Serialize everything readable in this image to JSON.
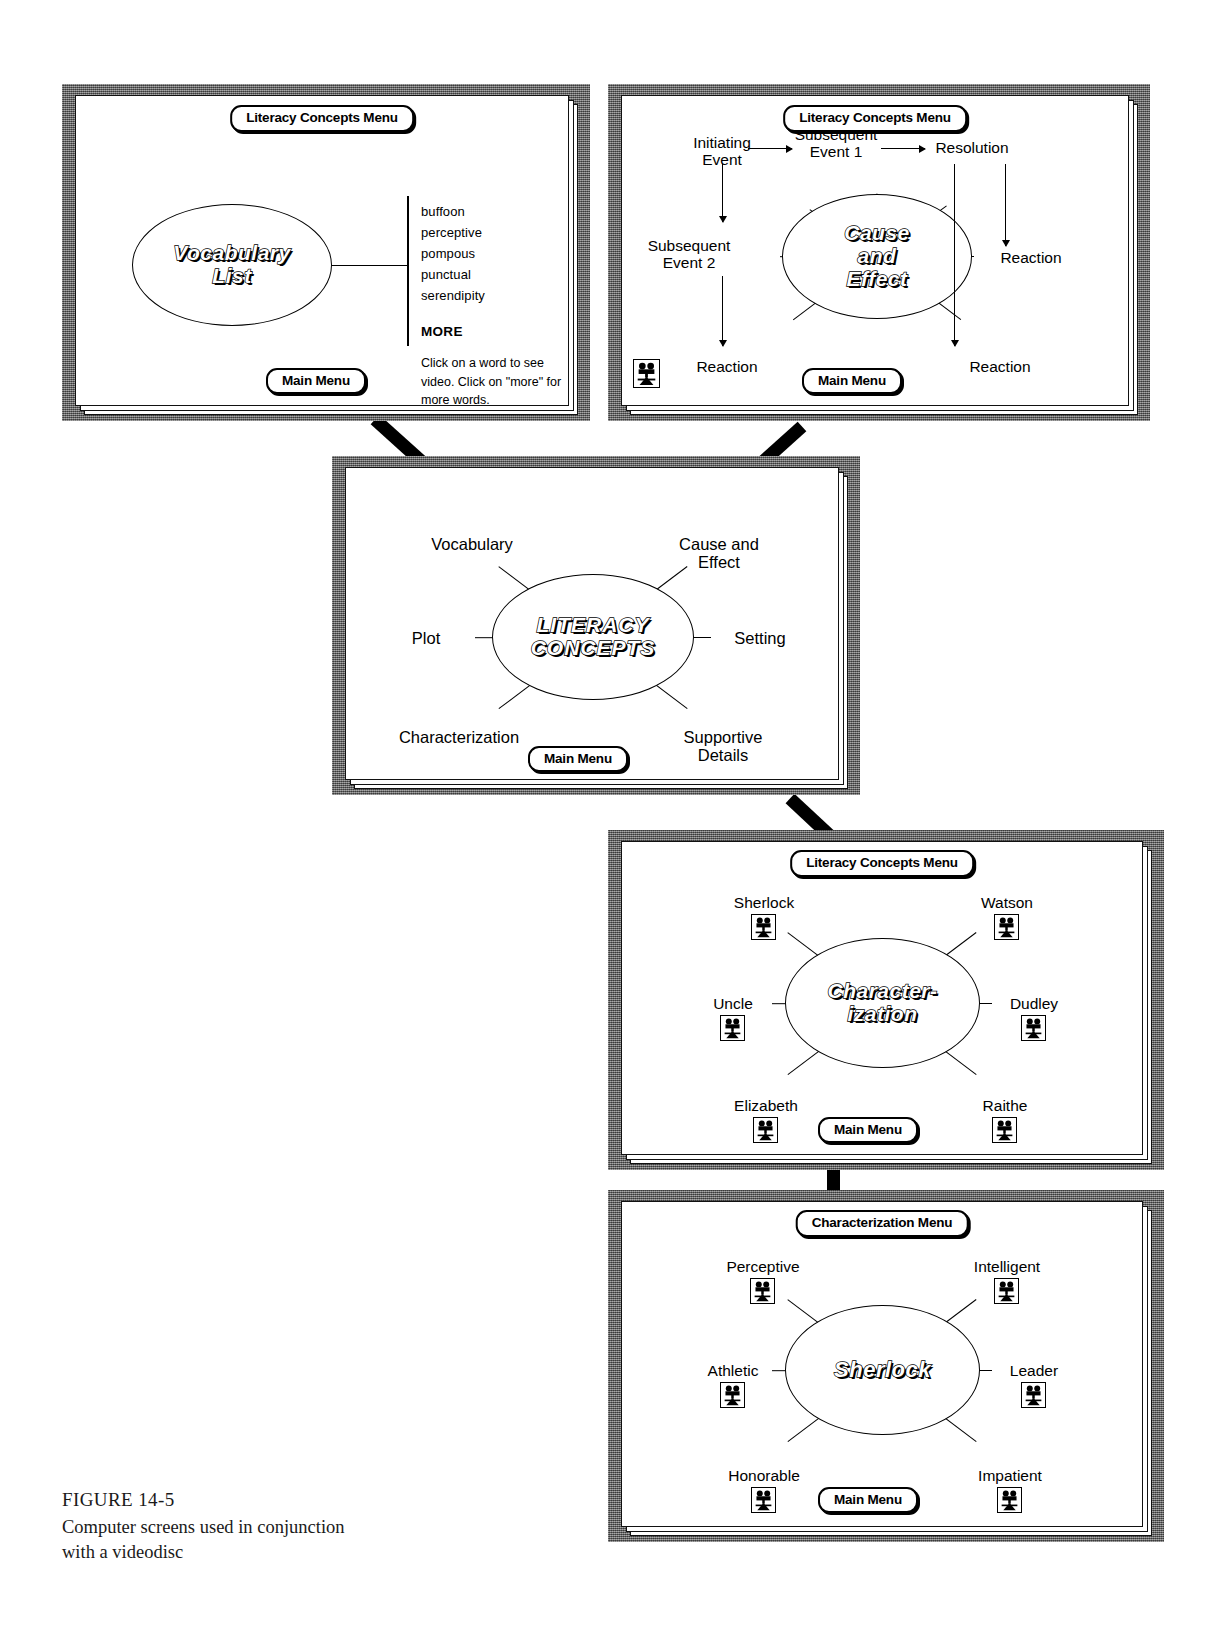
{
  "figure": {
    "number": "FIGURE 14-5",
    "caption": "Computer screens used in conjunction\nwith a videodisc"
  },
  "labels": {
    "main_menu": "Main Menu",
    "literacy_concepts_menu": "Literacy Concepts Menu",
    "characterization_menu": "Characterization Menu"
  },
  "screens": [
    {
      "id": "vocabulary-list",
      "titlebar": "Literacy Concepts Menu",
      "hub": "Vocabulary\nList",
      "main_menu": "Main Menu",
      "words": [
        "buffoon",
        "perceptive",
        "pompous",
        "punctual",
        "serendipity"
      ],
      "more": "MORE",
      "help": "Click on a word to see\nvideo.  Click on \"more\"\nfor more words."
    },
    {
      "id": "cause-and-effect",
      "titlebar": "Literacy Concepts Menu",
      "hub": "Cause\nand\nEffect",
      "main_menu": "Main Menu",
      "nodes": [
        "Initiating\nEvent",
        "Subsequent\nEvent 1",
        "Resolution",
        "Subsequent\nEvent 2",
        "Reaction",
        "Reaction",
        "Reaction"
      ],
      "has_video_icon": true
    },
    {
      "id": "literacy-concepts",
      "titlebar": "",
      "hub": "LITERACY\nCONCEPTS",
      "main_menu": "Main Menu",
      "nodes": [
        "Vocabulary",
        "Cause and Effect",
        "Plot",
        "Setting",
        "Characterization",
        "Supportive Details"
      ]
    },
    {
      "id": "characterization",
      "titlebar": "Literacy Concepts Menu",
      "hub": "Character-\nization",
      "main_menu": "Main Menu",
      "nodes": [
        "Sherlock",
        "Watson",
        "Uncle",
        "Dudley",
        "Elizabeth",
        "Raithe"
      ]
    },
    {
      "id": "sherlock",
      "titlebar": "Characterization Menu",
      "hub": "Sherlock",
      "main_menu": "Main Menu",
      "nodes": [
        "Perceptive",
        "Intelligent",
        "Athletic",
        "Leader",
        "Honorable",
        "Impatient"
      ]
    }
  ],
  "icons": {
    "video": "movie-camera-icon"
  },
  "colors": {
    "bezel": "#6b6b6b",
    "screen": "#ffffff",
    "ink": "#000000"
  }
}
